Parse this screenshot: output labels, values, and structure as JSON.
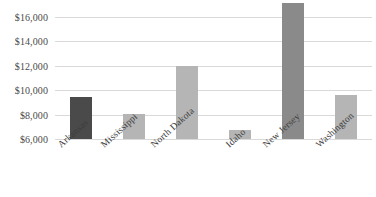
{
  "chart_data": {
    "type": "bar",
    "title": "",
    "subtitle": "",
    "xlabel": "",
    "ylabel": "",
    "categories": [
      "Arkansas",
      "Mississippi",
      "North Dakota",
      "Idaho",
      "New Jersey",
      "Washington"
    ],
    "values": [
      9450,
      8050,
      11950,
      6750,
      17150,
      9600
    ],
    "bar_colors": [
      "#4a4a4a",
      "#b5b5b5",
      "#b5b5b5",
      "#b5b5b5",
      "#8a8a8a",
      "#b5b5b5"
    ],
    "ylim": [
      6000,
      16000
    ],
    "y_axis_min_display": 6000,
    "y_ticks": [
      6000,
      8000,
      10000,
      12000,
      14000,
      16000
    ],
    "y_tick_labels": [
      "$6,000",
      "$8,000",
      "$10,000",
      "$12,000",
      "$14,000",
      "$16,000"
    ],
    "grid": true,
    "grid_color": "#d9d9d9",
    "legend": false,
    "legend_position": "none",
    "value_prefix": "$",
    "annotations": []
  },
  "colors": {
    "background": "#ffffff",
    "gridline": "#d9d9d9",
    "axis_text": "#4a4a4a",
    "category_text": "#3d3d3d",
    "bar_dark": "#4a4a4a",
    "bar_medium": "#8a8a8a",
    "bar_light": "#b5b5b5"
  }
}
